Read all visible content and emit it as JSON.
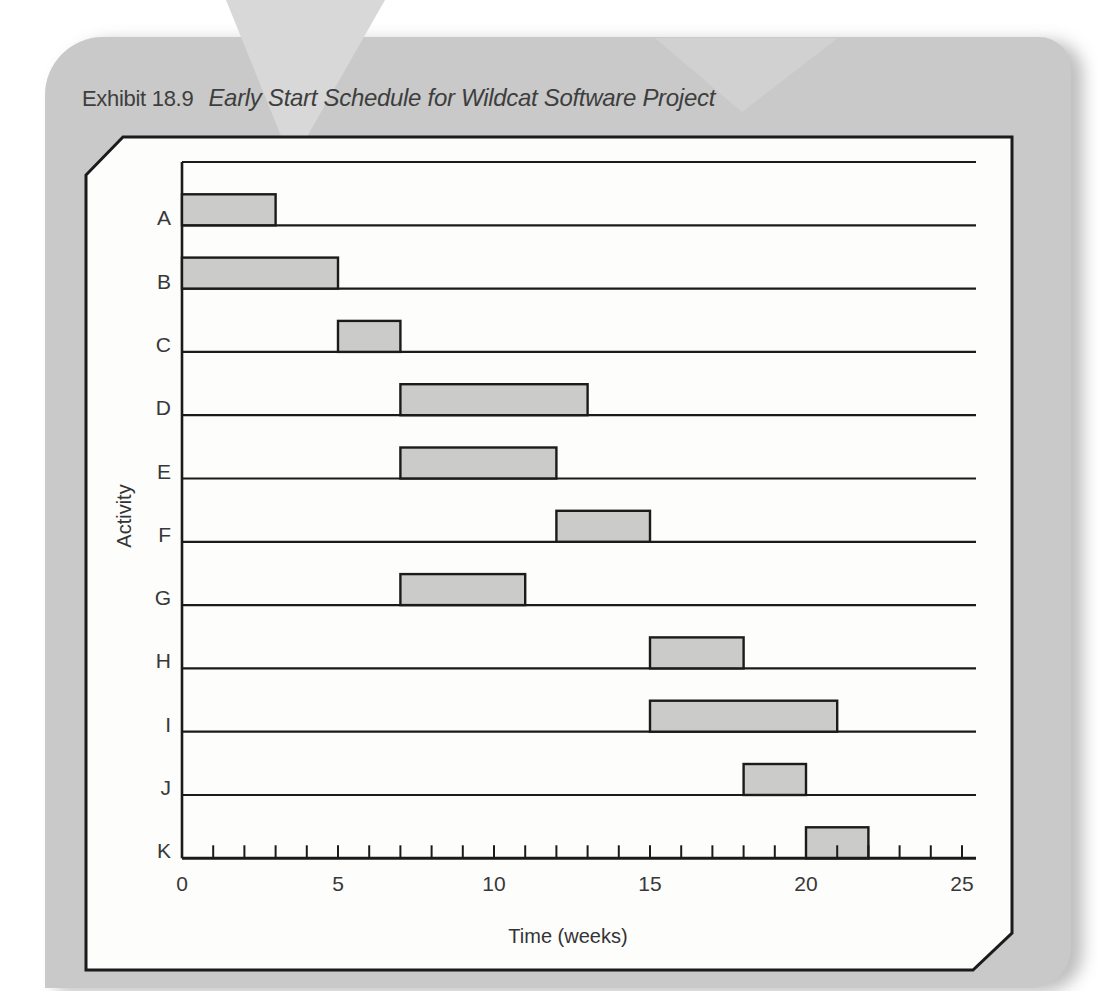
{
  "exhibit": {
    "label": "Exhibit 18.9",
    "title": "Early Start Schedule for Wildcat Software Project"
  },
  "chart_data": {
    "type": "bar",
    "subtype": "gantt-early-start-schedule",
    "title": "Early Start Schedule for Wildcat Software Project",
    "xlabel": "Time (weeks)",
    "ylabel": "Activity",
    "xlim": [
      0,
      25
    ],
    "xticks_labeled": [
      0,
      5,
      10,
      15,
      20,
      25
    ],
    "xtick_minor_step": 1,
    "grid": "horizontal-row-lines",
    "legend": "none",
    "activities": [
      {
        "name": "A",
        "start": 0,
        "end": 3
      },
      {
        "name": "B",
        "start": 0,
        "end": 5
      },
      {
        "name": "C",
        "start": 5,
        "end": 7
      },
      {
        "name": "D",
        "start": 7,
        "end": 13
      },
      {
        "name": "E",
        "start": 7,
        "end": 12
      },
      {
        "name": "F",
        "start": 12,
        "end": 15
      },
      {
        "name": "G",
        "start": 7,
        "end": 11
      },
      {
        "name": "H",
        "start": 15,
        "end": 18
      },
      {
        "name": "I",
        "start": 15,
        "end": 21
      },
      {
        "name": "J",
        "start": 18,
        "end": 20
      },
      {
        "name": "K",
        "start": 20,
        "end": 22
      }
    ],
    "colors": {
      "bar_fill": "#cbccca",
      "bar_stroke": "#1b1b1b",
      "line_color": "#1b1b1b",
      "text_color": "#383838",
      "panel_fill": "#fdfdfc",
      "card_bg": "#c8c9c8",
      "card_accent_light": "#d7d8d7"
    }
  }
}
